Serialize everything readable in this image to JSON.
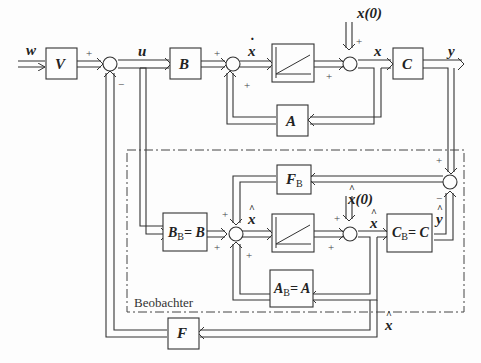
{
  "diagram": {
    "blocks": {
      "V": "V",
      "B": "B",
      "C": "C",
      "A": "A",
      "F": "F",
      "FB": "F",
      "FB_sub": "B",
      "BB": "B",
      "BB_sub": "B",
      "BB_rhs": "= B",
      "CB": "C",
      "CB_sub": "B",
      "CB_rhs": "= C",
      "AB": "A",
      "AB_sub": "B",
      "AB_rhs": "= A"
    },
    "signals": {
      "w": "w",
      "u": "u",
      "xdot": "x",
      "x": "x",
      "x0": "x(0)",
      "y": "y",
      "xhat_dot": "x",
      "xhat": "x",
      "xhat0": "x(0)",
      "yhat": "y",
      "xhat_bottom": "x"
    },
    "signs": {
      "plus": "+",
      "minus": "−"
    },
    "observer_label": "Beobachter"
  }
}
